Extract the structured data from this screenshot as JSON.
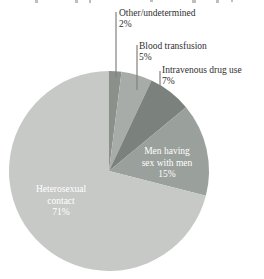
{
  "chart_data": {
    "type": "pie",
    "title": "",
    "unit": "%",
    "categories": [
      "Other/undetermined",
      "Blood transfusion",
      "Intravenous drug use",
      "Men having sex with men",
      "Heterosexual contact"
    ],
    "values": [
      2,
      5,
      7,
      15,
      71
    ],
    "slices": [
      {
        "label": "Other/undetermined",
        "value": 2,
        "pct_label": "2%",
        "color": "#8b908b",
        "label_position": "outside-callout"
      },
      {
        "label": "Blood transfusion",
        "value": 5,
        "pct_label": "5%",
        "color": "#a8aca8",
        "label_position": "outside-callout"
      },
      {
        "label": "Intravenous drug use",
        "value": 7,
        "pct_label": "7%",
        "color": "#7b817c",
        "label_position": "outside-callout"
      },
      {
        "label": "Men having sex with men",
        "value": 15,
        "pct_label": "15%",
        "color": "#9aa09b",
        "label_position": "inside",
        "label_lines": [
          "Men having",
          "sex with men",
          "15%"
        ]
      },
      {
        "label": "Heterosexual contact",
        "value": 71,
        "pct_label": "71%",
        "color": "#c7c9c7",
        "label_position": "inside",
        "label_lines": [
          "Heterosexual",
          "contact",
          "71%"
        ]
      }
    ],
    "start_angle": "12-o'clock",
    "direction": "clockwise",
    "legend": "none",
    "inside_label_color": "#ffffff",
    "outside_label_color": "#2f2f2f"
  }
}
